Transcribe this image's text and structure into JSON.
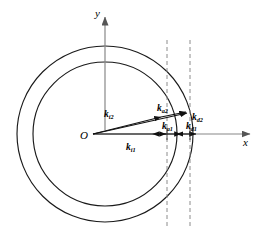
{
  "figure": {
    "background_color": "#ffffff",
    "stroke_color": "#1a1a1a",
    "axis_color": "#808080",
    "dash_color": "#8c8c8c"
  },
  "axes": {
    "x_label": "x",
    "y_label": "y",
    "origin_label": "O"
  },
  "circles": [
    {
      "name": "outer-circle",
      "cx": 105,
      "cy": 134,
      "r": 88
    },
    {
      "name": "inner-circle",
      "cx": 105,
      "cy": 134,
      "r": 72
    }
  ],
  "dashed_lines": [
    {
      "name": "dashed-line-left",
      "x": 167,
      "y1": 40,
      "y2": 228
    },
    {
      "name": "dashed-line-right",
      "x": 190,
      "y1": 40,
      "y2": 228
    }
  ],
  "vectors": [
    {
      "name": "k-i2",
      "label": "k",
      "sub": "i2",
      "label_x": 104,
      "label_y": 110
    },
    {
      "name": "k-i1",
      "label": "k",
      "sub": "i1",
      "label_x": 126,
      "label_y": 143
    },
    {
      "name": "k-a2",
      "label": "k",
      "sub": "a2",
      "label_x": 157,
      "label_y": 104
    },
    {
      "name": "k-d2",
      "label": "k",
      "sub": "d2",
      "label_x": 192,
      "label_y": 113
    },
    {
      "name": "k-a1",
      "label": "k",
      "sub": "a1",
      "label_x": 162,
      "label_y": 126
    },
    {
      "name": "k-d1",
      "label": "k",
      "sub": "d1",
      "label_x": 185,
      "label_y": 126
    }
  ]
}
